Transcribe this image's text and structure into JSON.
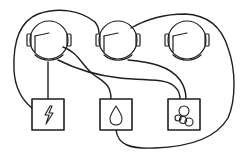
{
  "diagram": {
    "type": "utilities-connection-puzzle",
    "stroke_color": "#1e1e1e",
    "background": "#ffffff",
    "houses": [
      {
        "id": "helmet-1",
        "icon": "astronaut-helmet-icon",
        "cx": 49,
        "cy": 40
      },
      {
        "id": "helmet-2",
        "icon": "astronaut-helmet-icon",
        "cx": 118,
        "cy": 40
      },
      {
        "id": "helmet-3",
        "icon": "astronaut-helmet-icon",
        "cx": 187,
        "cy": 40
      }
    ],
    "utilities": [
      {
        "id": "electricity",
        "icon": "lightning-bolt-icon",
        "x": 32,
        "y": 99,
        "w": 32,
        "h": 31
      },
      {
        "id": "water",
        "icon": "water-drop-icon",
        "x": 100,
        "y": 99,
        "w": 32,
        "h": 31
      },
      {
        "id": "gas",
        "icon": "bubbles-icon",
        "x": 168,
        "y": 99,
        "w": 32,
        "h": 31
      }
    ],
    "connections": [
      {
        "from": "helmet-1",
        "to": "electricity"
      },
      {
        "from": "helmet-1",
        "to": "water"
      },
      {
        "from": "helmet-1",
        "to": "gas"
      },
      {
        "from": "helmet-2",
        "to": "gas"
      },
      {
        "from": "helmet-2",
        "to": "electricity"
      },
      {
        "from": "helmet-2",
        "to": "water"
      }
    ]
  }
}
